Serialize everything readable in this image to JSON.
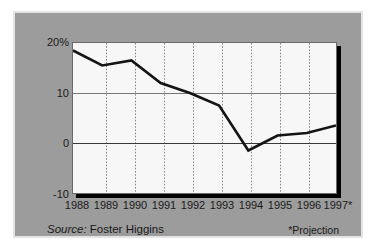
{
  "chart_data": {
    "type": "line",
    "title": "",
    "subtitle": "",
    "xlabel": "",
    "ylabel": "",
    "categories": [
      "1988",
      "1989",
      "1990",
      "1991",
      "1992",
      "1993",
      "1994",
      "1995",
      "1996",
      "1997*"
    ],
    "x": [
      1988,
      1989,
      1990,
      1991,
      1992,
      1993,
      1994,
      1995,
      1996,
      1997
    ],
    "series": [
      {
        "name": "Annual change in health benefit cost",
        "values": [
          18.5,
          15.5,
          16.5,
          12.0,
          10.0,
          7.5,
          -1.5,
          1.5,
          2.0,
          3.5
        ],
        "color": "#141414"
      }
    ],
    "values": [
      18.5,
      15.5,
      16.5,
      12.0,
      10.0,
      7.5,
      -1.5,
      1.5,
      2.0,
      3.5
    ],
    "ylim": [
      -10,
      20
    ],
    "yticks": [
      20,
      10,
      0,
      -10
    ],
    "ytick_labels": [
      "20%",
      "10",
      "0",
      "-10"
    ],
    "xtick_labels": [
      "1988",
      "1989",
      "1990",
      "1991",
      "1992",
      "1993",
      "1994",
      "1995",
      "1996",
      "1997*"
    ],
    "grid": {
      "horizontal": true,
      "vertical": true,
      "vertical_style": "dotted",
      "horizontal_style": "solid",
      "grid_color": "#888888"
    },
    "legend": {
      "visible": false,
      "position": "none",
      "entries": []
    },
    "annotations": [
      {
        "name": "source",
        "text": "Source: Foster Higgins"
      },
      {
        "name": "projection",
        "text": "*Projection"
      }
    ]
  },
  "footer": {
    "source_word": "Source:",
    "source_value": "Foster Higgins",
    "projection_note": "*Projection"
  },
  "colors": {
    "panel_background": "#9c9c9c",
    "panel_border": "#e4e4e4",
    "plot_background": "#f7f7f7",
    "plot_border": "#6a6a6a",
    "shadow": "#000000",
    "line": "#141414",
    "axis_text": "#1a1a1a",
    "gridline": "#888888",
    "zero_line": "#333333"
  }
}
